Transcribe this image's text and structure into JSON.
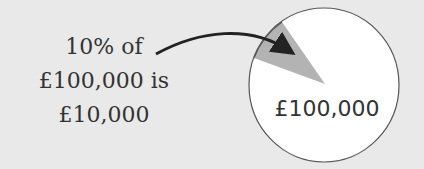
{
  "annotation": {
    "line1": "10% of",
    "line2": "£100,000 is",
    "line3": "£10,000"
  },
  "pie": {
    "total_label": "£100,000",
    "slice_percent": 10,
    "colors": {
      "background": "#e9e9e9",
      "pie": "#ffffff",
      "slice": "#b3b3b3",
      "outline": "#555555",
      "arrow": "#222222"
    }
  }
}
